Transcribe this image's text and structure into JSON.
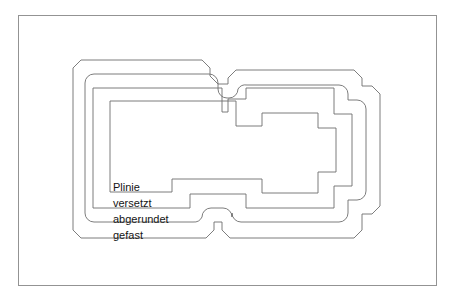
{
  "figure": {
    "width": 458,
    "height": 300,
    "background_color": "#ffffff",
    "frame": {
      "name": "drawing-frame",
      "x": 18,
      "y": 15,
      "width": 419,
      "height": 271,
      "stroke_color": "#939393",
      "stroke_width": 1
    },
    "labels": [
      {
        "id": "plinie",
        "text": "Plinie",
        "x": 113,
        "y": 191,
        "font_size": 11,
        "color": "#141414"
      },
      {
        "id": "versetzt",
        "text": "versetzt",
        "x": 113,
        "y": 207,
        "font_size": 11,
        "color": "#141414"
      },
      {
        "id": "abgerundet",
        "text": "abgerundet",
        "x": 113,
        "y": 223,
        "font_size": 11,
        "color": "#141414"
      },
      {
        "id": "gefast",
        "text": "gefast",
        "x": 113,
        "y": 239,
        "font_size": 11,
        "color": "#141414"
      }
    ],
    "outlines": [
      {
        "id": "plinie-outline",
        "name": "Plinie",
        "corner_style": "sharp",
        "stroke_color": "#6e6e6e",
        "stroke_width": 0.9,
        "path": "M 110 101 L 110 192 L 172 192 L 172 179 L 262 179 L 262 193 L 318 193 L 318 172 L 336 172 L 336 128 L 318 128 L 318 113 L 262 113 L 262 126 L 172 126 L 172 101 Z"
      },
      {
        "id": "versetzt-outline",
        "name": "versetzt",
        "corner_style": "sharp",
        "stroke_color": "#6e6e6e",
        "stroke_width": 0.9,
        "path": "M 93 88 L 93 208 L 190 208 L 190 194 L 246 194 L 246 208 L 334 208 L 334 186 L 352 186 L 352 114 L 334 114 L 334 99 L 246 99 L 246 112 L 228 112 L 228 88 Z"
      },
      {
        "id": "abgerundet-outline",
        "name": "abgerundet",
        "corner_style": "rounded",
        "stroke_color": "#6e6e6e",
        "stroke_width": 0.9,
        "path": "M 85 74 L 85 222 L 202 222 L 202 208 L 232 208 L 232 222 L 348 222 L 348 200 L 366 200 L 366 100 L 348 100 L 348 85 L 238 85 L 238 98 L 218 98 L 218 74 Z",
        "corner_radius": 9
      },
      {
        "id": "gefast-outline",
        "name": "gefast",
        "corner_style": "chamfered",
        "stroke_color": "#6e6e6e",
        "stroke_width": 0.9,
        "path": "M 73 60 L 73 238 L 214 238 L 214 222 L 222 222 L 222 238 L 362 238 L 362 214 L 380 214 L 380 86 L 362 86 L 362 70 L 228 70 L 228 84 L 210 84 L 210 60 Z",
        "chamfer_size": 8
      }
    ]
  }
}
